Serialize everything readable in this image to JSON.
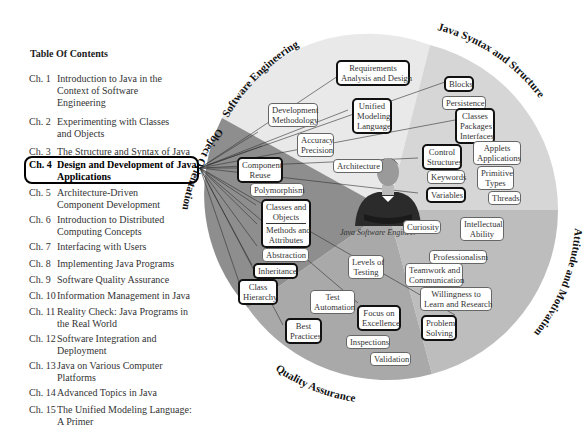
{
  "toc": {
    "title": "Table Of Contents",
    "chapters": [
      {
        "num": "Ch. 1",
        "title": "Introduction to Java in the Context of Software Engineering"
      },
      {
        "num": "Ch. 2",
        "title": "Experimenting with Classes and Objects"
      },
      {
        "num": "Ch. 3",
        "title": "The Structure and Syntax of Java"
      },
      {
        "num": "Ch. 4",
        "title": "Design and Development of Java Applications",
        "highlighted": true
      },
      {
        "num": "Ch. 5",
        "title": "Architecture-Driven Component Development"
      },
      {
        "num": "Ch. 6",
        "title": "Introduction to Distributed Computing Concepts"
      },
      {
        "num": "Ch. 7",
        "title": "Interfacing with Users"
      },
      {
        "num": "Ch. 8",
        "title": "Implementing Java Programs"
      },
      {
        "num": "Ch. 9",
        "title": "Software Quality Assurance"
      },
      {
        "num": "Ch. 10",
        "title": "Information Management in Java"
      },
      {
        "num": "Ch. 11",
        "title": "Reality Check: Java Programs in the Real World"
      },
      {
        "num": "Ch. 12",
        "title": "Software Integration and Deployment"
      },
      {
        "num": "Ch. 13",
        "title": "Java on Various Computer Platforms"
      },
      {
        "num": "Ch. 14",
        "title": "Advanced Topics in Java"
      },
      {
        "num": "Ch. 15",
        "title": "The Unified Modeling Language: A Primer"
      }
    ]
  },
  "wheel": {
    "center_caption": "Java Software Engineer",
    "sectors": [
      {
        "name": "Software Engineering",
        "color": "#e9e9e9"
      },
      {
        "name": "Java Syntax and Structure",
        "color": "#d6d6d6"
      },
      {
        "name": "Attitude and Motivation",
        "color": "#bdbdbd"
      },
      {
        "name": "Quality Assurance",
        "color": "#a9a9a9"
      },
      {
        "name": "Object Orientation",
        "color": "#8e8e8e"
      }
    ],
    "nodes": {
      "requirements": "Requirements Analysis and Design",
      "req_l1": "Requirements",
      "req_l2": "Analysis and Design",
      "dev_l1": "Development",
      "dev_l2": "Methodology",
      "uml_l1": "Unified",
      "uml_l2": "Modeling",
      "uml_l3": "Language",
      "acc_l1": "Accuracy",
      "acc_l2": "Precision",
      "architecture": "Architecture",
      "blocks": "Blocks",
      "persistence": "Persistence",
      "cpi_l1": "Classes",
      "cpi_l2": "Packages",
      "cpi_l3": "Interfaces",
      "cs_l1": "Control",
      "cs_l2": "Structures",
      "aa_l1": "Applets",
      "aa_l2": "Applications",
      "keywords": "Keywords",
      "pt_l1": "Primitive",
      "pt_l2": "Types",
      "variables": "Variables",
      "threads": "Threads",
      "cr_l1": "Component",
      "cr_l2": "Reuse",
      "polymorphism": "Polymorphism",
      "co_l1": "Classes and",
      "co_l2": "Objects",
      "ma_l1": "Methods and",
      "ma_l2": "Attributes",
      "abstraction": "Abstraction",
      "inheritance": "Inheritance",
      "ch_l1": "Class",
      "ch_l2": "Hierarchy",
      "curiosity": "Curiosity",
      "ia_l1": "Intellectual",
      "ia_l2": "Ability",
      "professionalism": "Professionalism",
      "tc_l1": "Teamwork and",
      "tc_l2": "Communication",
      "wl_l1": "Willingness to",
      "wl_l2": "Learn and Research",
      "ps_l1": "Problem",
      "ps_l2": "Solving",
      "lt_l1": "Levels of",
      "lt_l2": "Testing",
      "ta_l1": "Test",
      "ta_l2": "Automation",
      "fe_l1": "Focus on",
      "fe_l2": "Excellence",
      "bp_l1": "Best",
      "bp_l2": "Practices",
      "inspections": "Inspections",
      "validation": "Validation"
    }
  }
}
